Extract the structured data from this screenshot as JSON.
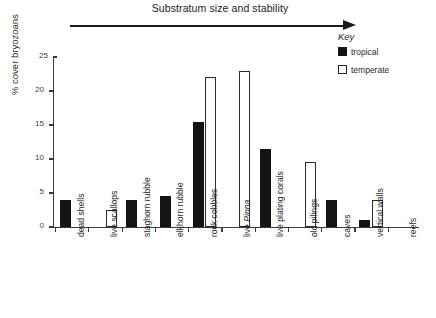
{
  "figure": {
    "arrow_caption": "Substratum size and stability",
    "arrow_icon": "right-arrow-icon"
  },
  "key": {
    "title": "Key",
    "entries": [
      {
        "label": "tropical",
        "swatch": "filled-square",
        "color": "#141414"
      },
      {
        "label": "temperate",
        "swatch": "open-square",
        "color": "#ffffff"
      }
    ]
  },
  "axes": {
    "ylabel": "% cover bryozoans",
    "yticks": [
      0,
      5,
      10,
      15,
      20,
      25
    ],
    "ytick_labels": [
      "0",
      "5",
      "10",
      "15",
      "20",
      "25"
    ],
    "ymin": 0,
    "ymax": 25
  },
  "chart_data": {
    "type": "bar",
    "title": "Substratum size and stability",
    "xlabel": "",
    "ylabel": "% cover bryozoans",
    "ylim": [
      0,
      25
    ],
    "yticks": [
      0,
      5,
      10,
      15,
      20,
      25
    ],
    "grid": false,
    "legend_position": "top-right",
    "annotations": [
      "Substratum size and stability"
    ],
    "categories": [
      "dead shells",
      "live scallops",
      "staghorn rubble",
      "elkhorn rubble",
      "rock cobbles",
      "live Pinna",
      "live plating corals",
      "old pilings",
      "caves",
      "vertical walls",
      "reefs"
    ],
    "categories_italic": [
      false,
      false,
      false,
      false,
      false,
      true,
      false,
      false,
      false,
      false,
      false
    ],
    "series": [
      {
        "name": "tropical",
        "color": "#141414",
        "values": [
          4,
          0,
          4,
          4.5,
          15.5,
          0,
          11.5,
          0,
          4,
          1,
          0
        ]
      },
      {
        "name": "temperate",
        "color": "#ffffff",
        "values": [
          0,
          2.5,
          0,
          0,
          22,
          23,
          0,
          9.5,
          0,
          4,
          0
        ]
      }
    ]
  }
}
